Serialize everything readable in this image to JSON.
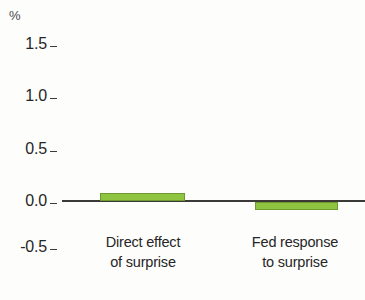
{
  "chart_data": {
    "type": "bar",
    "title": "",
    "subtitle": "",
    "xlabel": "",
    "ylabel": "%",
    "unit_label": "%",
    "categories": [
      "Direct effect of surprise",
      "Fed response to surprise"
    ],
    "category_lines": [
      [
        "Direct effect",
        "of surprise"
      ],
      [
        "Fed response",
        "to surprise"
      ]
    ],
    "values": [
      0.07,
      -0.08
    ],
    "ylim": [
      -0.5,
      1.5
    ],
    "yticks": [
      1.5,
      1.0,
      0.5,
      0.0,
      -0.5
    ],
    "ytick_labels": [
      "1.5",
      "1.0",
      "0.5",
      "0.0",
      "-0.5"
    ],
    "grid": false,
    "legend": false,
    "legend_position": "none",
    "bar_color": "#8fc440",
    "bar_edge_color": "#6f9a30",
    "axis_color": "#3c3a38",
    "background_color": "#fdfdfc",
    "text_color": "#262626"
  },
  "axis": {
    "unit": "%",
    "ticks": [
      {
        "label": "1.5",
        "value": 1.5
      },
      {
        "label": "1.0",
        "value": 1.0
      },
      {
        "label": "0.5",
        "value": 0.5
      },
      {
        "label": "0.0",
        "value": 0.0
      },
      {
        "label": "-0.5",
        "value": -0.5
      }
    ]
  },
  "bars": [
    {
      "name": "direct-effect-of-surprise",
      "line1": "Direct effect",
      "line2": "of surprise",
      "value": 0.07
    },
    {
      "name": "fed-response-to-surprise",
      "line1": "Fed response",
      "line2": "to surprise",
      "value": -0.08
    }
  ]
}
